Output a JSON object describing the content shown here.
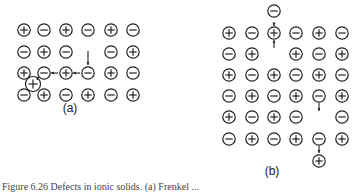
{
  "panels": [
    {
      "id": "a",
      "label": "(a)",
      "defect": "Frenkel",
      "lattice": [
        [
          "+",
          "-",
          "+",
          "-",
          "+",
          "-"
        ],
        [
          "-",
          "+",
          "-",
          "",
          "-",
          "+"
        ],
        [
          "+",
          "-",
          "+",
          "-",
          "+",
          "-"
        ],
        [
          "-",
          "+",
          "-",
          "+",
          "-",
          "+"
        ]
      ],
      "extras": [
        {
          "sign": "+",
          "type": "interstitial",
          "between_rows": [
            2,
            3
          ],
          "between_cols": [
            0,
            1
          ]
        }
      ],
      "arrows": [
        "vacancy-fill-from-above col 3 row 2",
        "chain row 2 col 3 to col 1 to interstitial"
      ]
    },
    {
      "id": "b",
      "label": "(b)",
      "defect": "Schottky",
      "lattice": [
        [
          "+",
          "-",
          "+",
          "-",
          "+",
          "-"
        ],
        [
          "-",
          "+",
          "",
          "+",
          "-",
          "+"
        ],
        [
          "+",
          "-",
          "+",
          "-",
          "+",
          "-"
        ],
        [
          "-",
          "+",
          "-",
          "+",
          "-",
          "+"
        ],
        [
          "+",
          "-",
          "+",
          "-",
          "",
          "-"
        ],
        [
          "-",
          "+",
          "-",
          "+",
          "-",
          "+"
        ]
      ],
      "extras": [
        {
          "sign": "-",
          "type": "surface",
          "position": "above col 2"
        },
        {
          "sign": "+",
          "type": "surface",
          "position": "below col 4"
        }
      ]
    }
  ],
  "caption": "Figure 6.26  Defects in ionic solids. (a) Frenkel ..."
}
